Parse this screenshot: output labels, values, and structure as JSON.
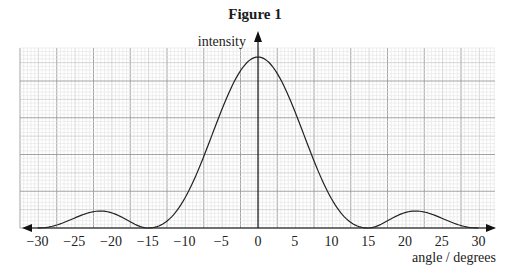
{
  "title": "Figure 1",
  "chart_data": {
    "type": "line",
    "title": "Figure 1",
    "xlabel": "angle / degrees",
    "ylabel": "intensity",
    "xlim": [
      -30,
      30
    ],
    "x_ticks": [
      -30,
      -25,
      -20,
      -15,
      -10,
      -5,
      0,
      5,
      10,
      15,
      20,
      25,
      30
    ],
    "x_tick_labels": [
      "−30",
      "−25",
      "−20",
      "−15",
      "−10",
      "−5",
      "0",
      "5",
      "10",
      "15",
      "20",
      "25",
      "30"
    ],
    "grid": true,
    "y_ticks_labeled": false,
    "series": [
      {
        "name": "intensity",
        "x": [
          -30,
          -27.5,
          -25,
          -23.5,
          -22,
          -20,
          -17.5,
          -15,
          -12.5,
          -10,
          -7.5,
          -5,
          -2.5,
          0,
          2.5,
          5,
          7.5,
          10,
          12.5,
          15,
          17.5,
          20,
          22,
          23.5,
          25,
          27.5,
          30
        ],
        "y": [
          0,
          0.06,
          0.09,
          0.1,
          0.095,
          0.07,
          0.025,
          0,
          0.06,
          0.3,
          0.57,
          0.8,
          0.95,
          1.0,
          0.95,
          0.8,
          0.57,
          0.3,
          0.06,
          0,
          0.025,
          0.07,
          0.095,
          0.1,
          0.09,
          0.06,
          0
        ]
      }
    ]
  },
  "axis_labels": {
    "x": "angle / degrees",
    "y": "intensity"
  }
}
